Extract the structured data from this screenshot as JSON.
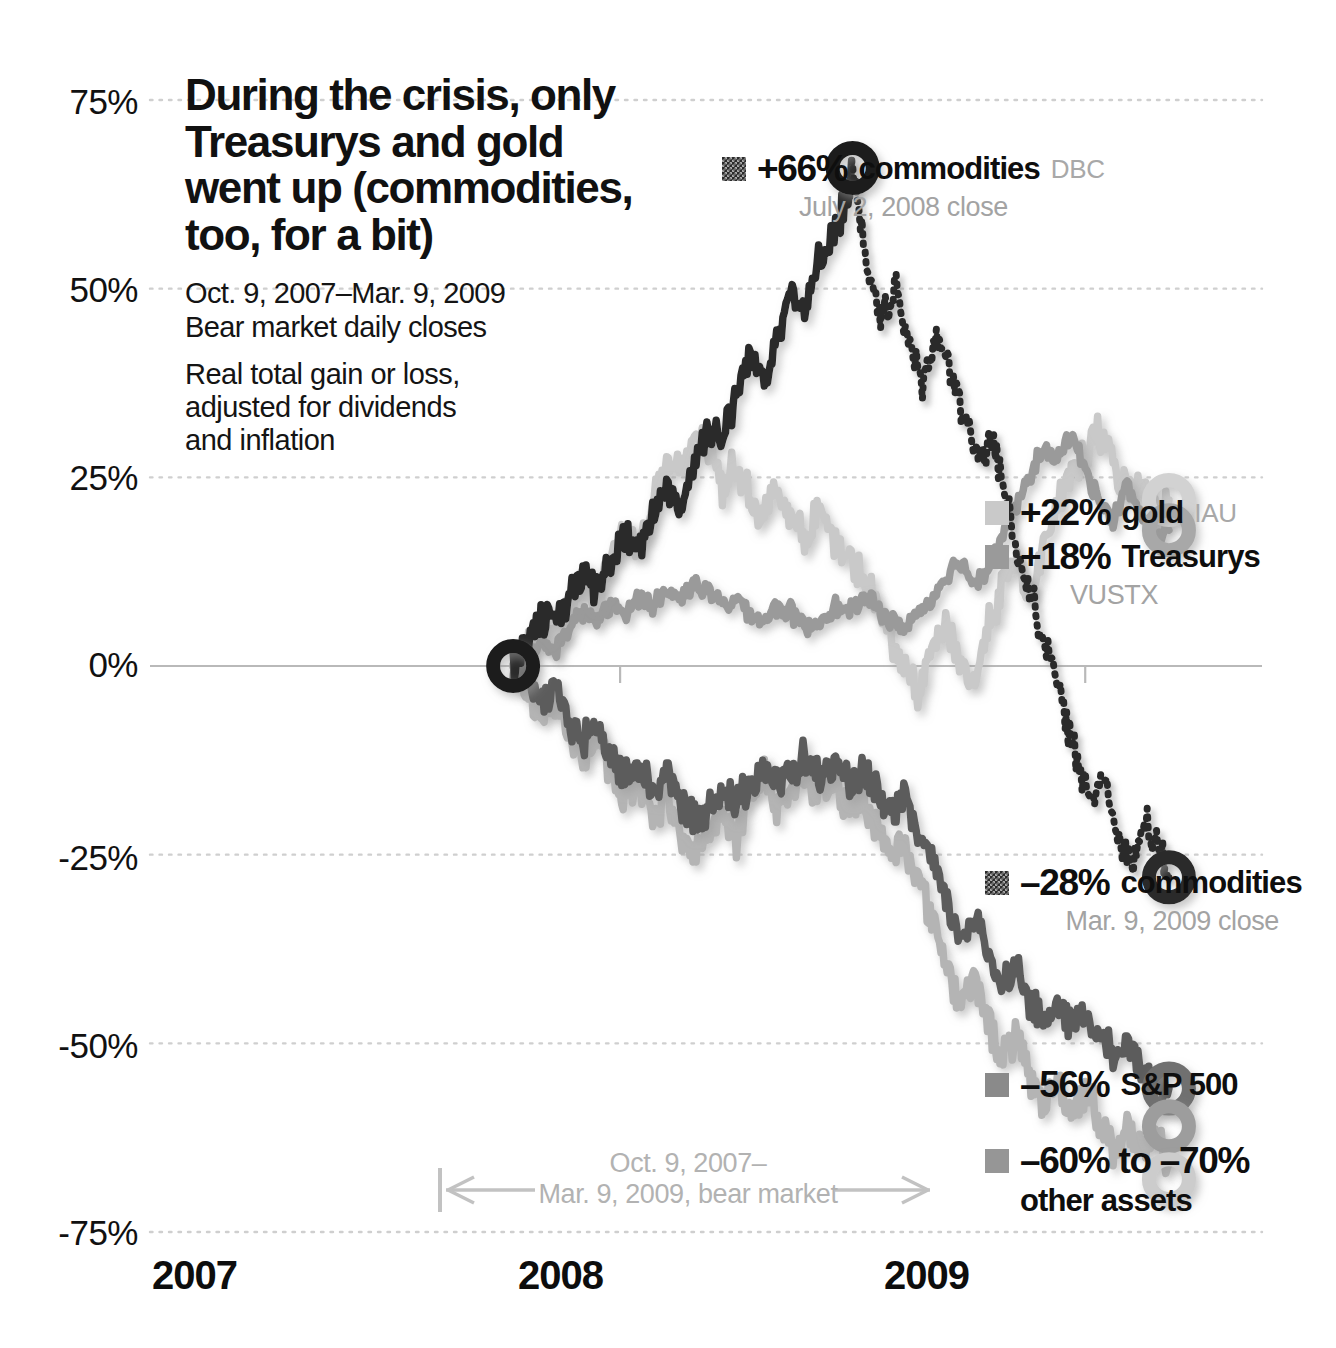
{
  "headline": {
    "line1": "During the crisis, only",
    "line2": "Treasurys and gold",
    "line3": "went up (commodities,",
    "line4": "too, for a bit)"
  },
  "subhead": {
    "daterange": "Oct. 9, 2007–Mar. 9, 2009",
    "closes": "Bear market daily closes",
    "note_line1": "Real total gain or loss,",
    "note_line2": "adjusted for dividends",
    "note_line3": "and inflation"
  },
  "bear_note": {
    "line1": "Oct. 9, 2007–",
    "line2": "Mar. 9, 2009, bear market"
  },
  "callouts": {
    "commodities_peak": {
      "value": "+66%",
      "name": "commodities",
      "ticker": "DBC",
      "sub": "July 2, 2008 close"
    },
    "gold": {
      "value": "+22%",
      "name": "gold",
      "ticker": "IAU"
    },
    "treasurys": {
      "value": "+18%",
      "name": "Treasurys",
      "ticker": "VUSTX"
    },
    "commodities_end": {
      "value": "–28%",
      "name": "commodities",
      "sub": "Mar. 9, 2009 close"
    },
    "sp500": {
      "value": "–56%",
      "name": "S&P 500"
    },
    "other_assets": {
      "value": "–60% to –70%",
      "name": "other assets"
    }
  },
  "colors": {
    "commodities": "#2b2b2b",
    "gold": "#c9c9c9",
    "treasurys": "#9a9a9a",
    "sp500": "#5c5c5c",
    "other_assets": "#b4b4b4",
    "gridline": "#cfcfcf",
    "zeroline": "#b9b9b9",
    "muted_text": "#a8a8a8"
  },
  "chart_data": {
    "type": "line",
    "title": "During the crisis, only Treasurys and gold went up (commodities, too, for a bit)",
    "subtitle": "Oct. 9, 2007–Mar. 9, 2009 Bear market daily closes. Real total gain or loss, adjusted for dividends and inflation",
    "xlabel": "",
    "ylabel": "Real total gain or loss (%)",
    "ylim": [
      -75,
      75
    ],
    "yticks": [
      75,
      50,
      25,
      0,
      -25,
      -50,
      -75
    ],
    "ytick_labels": [
      "75%",
      "50%",
      "25%",
      "0%",
      "-25%",
      "-50%",
      "-75%"
    ],
    "xticks": [
      2007,
      2008,
      2009
    ],
    "xtick_labels": [
      "2007",
      "2008",
      "2009"
    ],
    "xlim": [
      2007.0,
      2009.35
    ],
    "grid": true,
    "legend": "right-inline",
    "annotations": [
      {
        "text": "+66% commodities DBC, July 2, 2008 close",
        "x": 2008.5,
        "y": 66
      },
      {
        "text": "+22% gold IAU",
        "x": 2009.19,
        "y": 22
      },
      {
        "text": "+18% Treasurys VUSTX",
        "x": 2009.19,
        "y": 18
      },
      {
        "text": "-28% commodities, Mar. 9, 2009 close",
        "x": 2009.19,
        "y": -28
      },
      {
        "text": "-56% S&P 500",
        "x": 2009.19,
        "y": -56
      },
      {
        "text": "-60% to -70% other assets",
        "x": 2009.19,
        "y": -66
      }
    ],
    "series": [
      {
        "name": "commodities",
        "ticker": "DBC",
        "style": "dotted-after-peak",
        "color": "#2b2b2b",
        "start_value": 0,
        "peak_value": 66,
        "peak_date": "July 2, 2008",
        "end_value": -28,
        "x": [
          2007.77,
          2007.8,
          2007.83,
          2007.86,
          2007.89,
          2007.92,
          2007.95,
          2007.98,
          2008.01,
          2008.04,
          2008.07,
          2008.1,
          2008.13,
          2008.16,
          2008.19,
          2008.22,
          2008.25,
          2008.28,
          2008.31,
          2008.34,
          2008.37,
          2008.4,
          2008.43,
          2008.46,
          2008.49,
          2008.5,
          2008.53,
          2008.56,
          2008.59,
          2008.62,
          2008.65,
          2008.68,
          2008.71,
          2008.74,
          2008.77,
          2008.8,
          2008.83,
          2008.86,
          2008.89,
          2008.92,
          2008.95,
          2008.98,
          2009.01,
          2009.04,
          2009.07,
          2009.1,
          2009.13,
          2009.16,
          2009.18
        ],
        "y": [
          0,
          4,
          7,
          5,
          9,
          12,
          10,
          14,
          17,
          15,
          20,
          24,
          21,
          27,
          32,
          30,
          36,
          41,
          38,
          45,
          50,
          47,
          54,
          58,
          62,
          66,
          52,
          46,
          50,
          43,
          38,
          44,
          39,
          33,
          27,
          30,
          22,
          14,
          8,
          2,
          -5,
          -12,
          -18,
          -14,
          -22,
          -26,
          -21,
          -25,
          -28
        ]
      },
      {
        "name": "gold",
        "ticker": "IAU",
        "style": "solid",
        "color": "#c9c9c9",
        "start_value": 0,
        "end_value": 22,
        "x": [
          2007.77,
          2007.8,
          2007.83,
          2007.86,
          2007.89,
          2007.92,
          2007.95,
          2007.98,
          2008.01,
          2008.04,
          2008.07,
          2008.1,
          2008.13,
          2008.16,
          2008.19,
          2008.22,
          2008.25,
          2008.28,
          2008.31,
          2008.34,
          2008.37,
          2008.4,
          2008.43,
          2008.46,
          2008.49,
          2008.52,
          2008.55,
          2008.58,
          2008.61,
          2008.64,
          2008.67,
          2008.7,
          2008.73,
          2008.76,
          2008.79,
          2008.82,
          2008.85,
          2008.88,
          2008.91,
          2008.94,
          2008.97,
          2009.0,
          2009.03,
          2009.06,
          2009.09,
          2009.12,
          2009.15,
          2009.18
        ],
        "y": [
          0,
          2,
          5,
          3,
          8,
          11,
          9,
          14,
          18,
          16,
          22,
          27,
          25,
          31,
          29,
          24,
          27,
          22,
          20,
          24,
          19,
          17,
          21,
          16,
          14,
          12,
          8,
          4,
          0,
          -4,
          2,
          6,
          1,
          -3,
          5,
          10,
          14,
          9,
          16,
          21,
          25,
          28,
          31,
          27,
          23,
          25,
          20,
          22
        ]
      },
      {
        "name": "Treasurys",
        "ticker": "VUSTX",
        "style": "solid",
        "color": "#9a9a9a",
        "start_value": 0,
        "end_value": 18,
        "x": [
          2007.77,
          2007.8,
          2007.83,
          2007.86,
          2007.89,
          2007.92,
          2007.95,
          2007.98,
          2008.01,
          2008.04,
          2008.07,
          2008.1,
          2008.13,
          2008.16,
          2008.19,
          2008.22,
          2008.25,
          2008.28,
          2008.31,
          2008.34,
          2008.37,
          2008.4,
          2008.43,
          2008.46,
          2008.49,
          2008.52,
          2008.55,
          2008.58,
          2008.61,
          2008.64,
          2008.67,
          2008.7,
          2008.73,
          2008.76,
          2008.79,
          2008.82,
          2008.85,
          2008.88,
          2008.91,
          2008.94,
          2008.97,
          2009.0,
          2009.03,
          2009.06,
          2009.09,
          2009.12,
          2009.15,
          2009.18
        ],
        "y": [
          0,
          1,
          3,
          2,
          5,
          7,
          6,
          8,
          7,
          9,
          8,
          10,
          9,
          11,
          10,
          8,
          9,
          7,
          6,
          8,
          7,
          5,
          6,
          8,
          7,
          9,
          8,
          6,
          5,
          7,
          9,
          12,
          14,
          11,
          13,
          17,
          21,
          25,
          29,
          27,
          31,
          26,
          22,
          19,
          24,
          20,
          17,
          18
        ]
      },
      {
        "name": "S&P 500",
        "ticker": "",
        "style": "solid",
        "color": "#5c5c5c",
        "start_value": 0,
        "end_value": -56,
        "x": [
          2007.77,
          2007.8,
          2007.83,
          2007.86,
          2007.89,
          2007.92,
          2007.95,
          2007.98,
          2008.01,
          2008.04,
          2008.07,
          2008.1,
          2008.13,
          2008.16,
          2008.19,
          2008.22,
          2008.25,
          2008.28,
          2008.31,
          2008.34,
          2008.37,
          2008.4,
          2008.43,
          2008.46,
          2008.49,
          2008.52,
          2008.55,
          2008.58,
          2008.61,
          2008.64,
          2008.67,
          2008.7,
          2008.73,
          2008.76,
          2008.79,
          2008.82,
          2008.85,
          2008.88,
          2008.91,
          2008.94,
          2008.97,
          2009.0,
          2009.03,
          2009.06,
          2009.09,
          2009.12,
          2009.15,
          2009.18
        ],
        "y": [
          0,
          -2,
          -5,
          -3,
          -7,
          -10,
          -8,
          -12,
          -15,
          -13,
          -17,
          -14,
          -18,
          -21,
          -19,
          -16,
          -19,
          -15,
          -13,
          -16,
          -14,
          -12,
          -15,
          -13,
          -16,
          -14,
          -17,
          -20,
          -18,
          -22,
          -26,
          -31,
          -36,
          -33,
          -38,
          -42,
          -40,
          -44,
          -47,
          -45,
          -48,
          -46,
          -49,
          -52,
          -50,
          -53,
          -55,
          -56
        ]
      },
      {
        "name": "other assets",
        "ticker": "",
        "style": "solid",
        "color": "#b4b4b4",
        "start_value": 0,
        "end_value": -66,
        "range": [
          -60,
          -70
        ],
        "x": [
          2007.77,
          2007.8,
          2007.83,
          2007.86,
          2007.89,
          2007.92,
          2007.95,
          2007.98,
          2008.01,
          2008.04,
          2008.07,
          2008.1,
          2008.13,
          2008.16,
          2008.19,
          2008.22,
          2008.25,
          2008.28,
          2008.31,
          2008.34,
          2008.37,
          2008.4,
          2008.43,
          2008.46,
          2008.49,
          2008.52,
          2008.55,
          2008.58,
          2008.61,
          2008.64,
          2008.67,
          2008.7,
          2008.73,
          2008.76,
          2008.79,
          2008.82,
          2008.85,
          2008.88,
          2008.91,
          2008.94,
          2008.97,
          2009.0,
          2009.03,
          2009.06,
          2009.09,
          2009.12,
          2009.15,
          2009.18
        ],
        "y": [
          0,
          -3,
          -6,
          -4,
          -9,
          -12,
          -10,
          -14,
          -18,
          -15,
          -20,
          -17,
          -22,
          -25,
          -22,
          -19,
          -23,
          -18,
          -15,
          -19,
          -16,
          -14,
          -18,
          -15,
          -19,
          -17,
          -21,
          -25,
          -23,
          -28,
          -33,
          -39,
          -45,
          -41,
          -47,
          -52,
          -49,
          -54,
          -58,
          -55,
          -59,
          -56,
          -60,
          -64,
          -61,
          -65,
          -63,
          -66
        ]
      }
    ]
  }
}
